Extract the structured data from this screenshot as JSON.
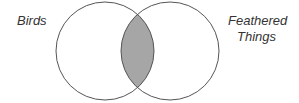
{
  "diagram": {
    "type": "venn",
    "sets": [
      {
        "label": "Birds"
      },
      {
        "label_lines": [
          "Feathered",
          "Things"
        ]
      }
    ],
    "intersection": {
      "shaded": true,
      "color": "#a6a6a6"
    },
    "stroke_color": "#555555"
  }
}
